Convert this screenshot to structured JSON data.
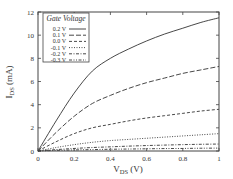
{
  "chart_data": {
    "type": "line",
    "title": "",
    "xlabel": "V_DS (V)",
    "ylabel": "I_DS (mA)",
    "xlim": [
      0,
      1
    ],
    "ylim": [
      0,
      12
    ],
    "xticks": [
      "0",
      "0.2",
      "0.4",
      "0.6",
      "0.8",
      "1"
    ],
    "yticks": [
      "0",
      "2",
      "4",
      "6",
      "8",
      "10",
      "12"
    ],
    "grid": false,
    "legend": {
      "title": "Gate Voltage",
      "position": "upper left"
    },
    "x": [
      0,
      0.1,
      0.2,
      0.3,
      0.4,
      0.5,
      0.6,
      0.7,
      0.8,
      0.9,
      1.0
    ],
    "series": [
      {
        "name": "0.2 V",
        "style": "solid",
        "values": [
          0,
          2.6,
          5.0,
          6.9,
          8.0,
          8.8,
          9.5,
          10.1,
          10.6,
          11.1,
          11.5
        ]
      },
      {
        "name": "0.1 V",
        "style": "dashed-long",
        "values": [
          0,
          1.6,
          3.0,
          4.1,
          4.8,
          5.4,
          5.9,
          6.3,
          6.7,
          7.0,
          7.3
        ]
      },
      {
        "name": "0.0 V",
        "style": "dashed",
        "values": [
          0,
          0.8,
          1.5,
          2.0,
          2.3,
          2.6,
          2.85,
          3.05,
          3.25,
          3.45,
          3.6
        ]
      },
      {
        "name": "-0.1 V",
        "style": "dotted",
        "values": [
          0,
          0.3,
          0.55,
          0.75,
          0.9,
          1.0,
          1.1,
          1.2,
          1.3,
          1.4,
          1.5
        ]
      },
      {
        "name": "-0.2 V",
        "style": "dash-dot",
        "values": [
          0,
          0.12,
          0.22,
          0.3,
          0.36,
          0.42,
          0.47,
          0.51,
          0.55,
          0.58,
          0.6
        ]
      },
      {
        "name": "-0.3 V",
        "style": "dash-dot-dot",
        "values": [
          0,
          0.05,
          0.09,
          0.12,
          0.15,
          0.17,
          0.19,
          0.21,
          0.22,
          0.24,
          0.25
        ]
      }
    ]
  },
  "labels": {
    "ylabel_main": "I",
    "ylabel_sub": "DS",
    "ylabel_unit": " (mA)",
    "xlabel_main": "V",
    "xlabel_sub": "DS",
    "xlabel_unit": " (V)",
    "legend_title": "Gate Voltage"
  }
}
